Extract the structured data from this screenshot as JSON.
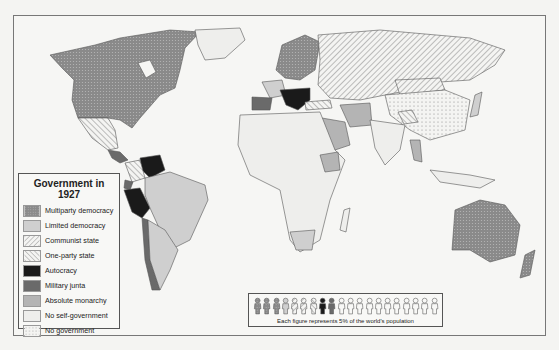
{
  "legend": {
    "title": "Government in 1927",
    "items": [
      {
        "label": "Multiparty democracy",
        "key": "multiparty",
        "color": "#8a8a8a",
        "pattern": "dotted-dark"
      },
      {
        "label": "Limited democracy",
        "key": "limited",
        "color": "#cfcfcf",
        "pattern": "solid"
      },
      {
        "label": "Communist state",
        "key": "communist",
        "color": "#f2f2f2",
        "pattern": "hatch-forward"
      },
      {
        "label": "One-party state",
        "key": "oneparty",
        "color": "#f2f2f2",
        "pattern": "hatch-back"
      },
      {
        "label": "Autocracy",
        "key": "autocracy",
        "color": "#1a1a1a",
        "pattern": "solid"
      },
      {
        "label": "Military junta",
        "key": "junta",
        "color": "#6a6a6a",
        "pattern": "solid"
      },
      {
        "label": "Absolute monarchy",
        "key": "monarchy",
        "color": "#b4b4b4",
        "pattern": "solid"
      },
      {
        "label": "No self-government",
        "key": "noself",
        "color": "#eeeeec",
        "pattern": "solid"
      },
      {
        "label": "No government",
        "key": "nogov",
        "color": "#f4f4f2",
        "pattern": "dotted-light"
      }
    ]
  },
  "population": {
    "caption": "Each figure represents 5% of the world's population",
    "figures": [
      "multiparty",
      "multiparty",
      "multiparty",
      "limited",
      "communist",
      "communist",
      "oneparty",
      "autocracy",
      "junta",
      "noself",
      "noself",
      "noself",
      "noself",
      "noself",
      "noself",
      "noself",
      "noself",
      "noself",
      "noself",
      "noself"
    ]
  },
  "map": {
    "regions": [
      {
        "name": "North America (USA/Canada)",
        "gov": "multiparty"
      },
      {
        "name": "Greenland",
        "gov": "noself"
      },
      {
        "name": "Mexico",
        "gov": "oneparty"
      },
      {
        "name": "Venezuela",
        "gov": "autocracy"
      },
      {
        "name": "Peru",
        "gov": "autocracy"
      },
      {
        "name": "Chile",
        "gov": "junta"
      },
      {
        "name": "Brazil / Argentina",
        "gov": "limited"
      },
      {
        "name": "Soviet Union",
        "gov": "communist"
      },
      {
        "name": "Italy",
        "gov": "autocracy"
      },
      {
        "name": "Spain",
        "gov": "junta"
      },
      {
        "name": "Northern Europe",
        "gov": "multiparty"
      },
      {
        "name": "China",
        "gov": "nogov"
      },
      {
        "name": "Mongolia",
        "gov": "communist"
      },
      {
        "name": "Japan",
        "gov": "limited"
      },
      {
        "name": "Saudi Arabia / Persia / Ethiopia",
        "gov": "monarchy"
      },
      {
        "name": "Africa / India (colonies)",
        "gov": "noself"
      },
      {
        "name": "Australia / New Zealand",
        "gov": "multiparty"
      }
    ]
  }
}
